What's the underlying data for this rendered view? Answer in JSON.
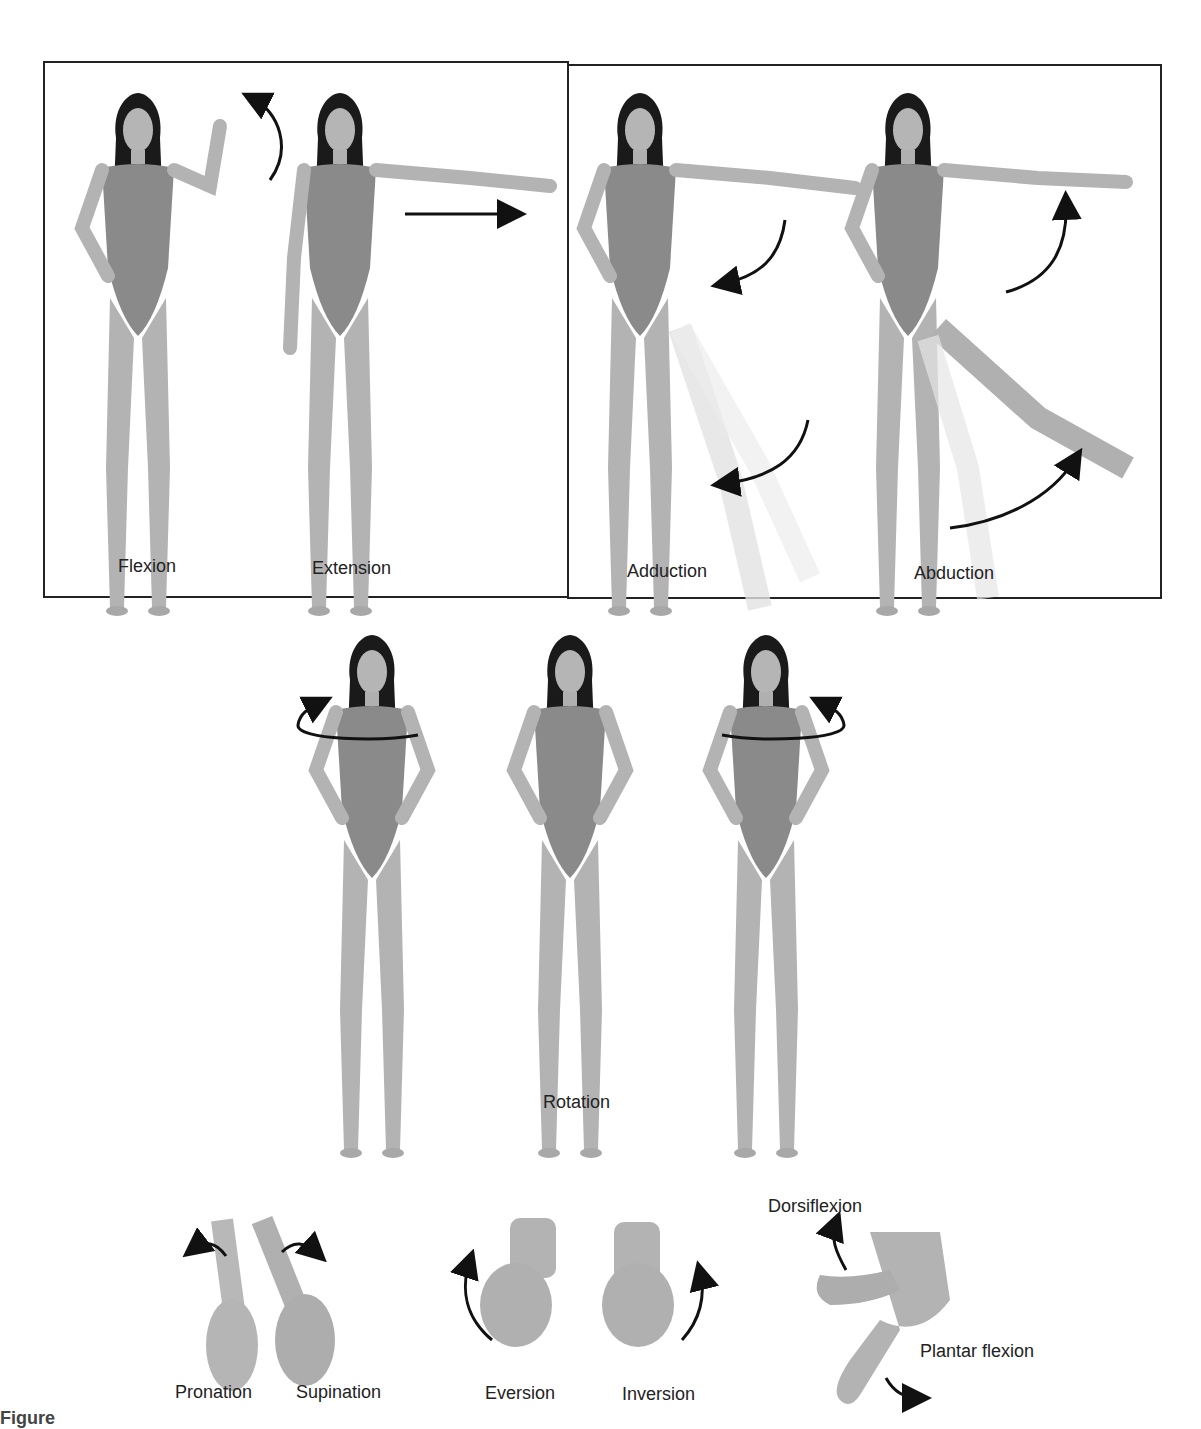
{
  "header": {
    "cut_text": "…upper margin text (cut off)…"
  },
  "panels": {
    "left_box": {
      "labels": [
        "Flexion",
        "Extension"
      ]
    },
    "right_box": {
      "labels": [
        "Adduction",
        "Abduction"
      ]
    },
    "rotation": {
      "label": "Rotation"
    },
    "bottom": {
      "labels": [
        "Pronation",
        "Supination",
        "Eversion",
        "Inversion",
        "Dorsiflexion",
        "Plantar flexion"
      ]
    }
  },
  "caption": {
    "text": "Figure"
  },
  "colors": {
    "skin": "#b8b8b8",
    "suit": "#8a8a8a",
    "hair": "#1a1a1a",
    "arrow": "#111111",
    "frame": "#222222"
  }
}
